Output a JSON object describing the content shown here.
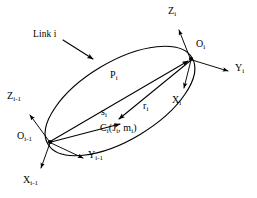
{
  "figure": {
    "kind": "kinematic-link-diagram",
    "background_color": "#ffffff",
    "ink_color": "#000000",
    "width": 257,
    "height": 198
  },
  "annotation": {
    "link_label": "Link i",
    "leader_note": "arrow from Link i text to upper-left boundary of the link body ellipse"
  },
  "body": {
    "name": "link-body-ellipse",
    "center_x": 120,
    "center_y": 101,
    "radius_x": 84,
    "radius_y": 39,
    "rotation_deg": -31
  },
  "frames": [
    {
      "id": "frame-i-minus-1",
      "origin_label": "O",
      "origin_subscript": "i-1",
      "origin_x": 50,
      "origin_y": 142,
      "axes": [
        {
          "id": "z-axis",
          "label": "Z",
          "subscript": "i-1",
          "tip_x": 28,
          "tip_y": 112
        },
        {
          "id": "y-axis",
          "label": "Y",
          "subscript": "i-1",
          "tip_x": 86,
          "tip_y": 160
        },
        {
          "id": "x-axis",
          "label": "X",
          "subscript": "i-1",
          "tip_x": 39,
          "tip_y": 171
        }
      ]
    },
    {
      "id": "frame-i",
      "origin_label": "O",
      "origin_subscript": "i",
      "origin_x": 191,
      "origin_y": 59,
      "axes": [
        {
          "id": "z-axis",
          "label": "Z",
          "subscript": "i",
          "tip_x": 178,
          "tip_y": 27
        },
        {
          "id": "y-axis",
          "label": "Y",
          "subscript": "i",
          "tip_x": 231,
          "tip_y": 73
        },
        {
          "id": "x-axis",
          "label": "X",
          "subscript": "i",
          "tip_x": 184,
          "tip_y": 91
        }
      ]
    }
  ],
  "mass_center": {
    "id": "center-of-mass",
    "label": "C",
    "subscript": "i",
    "parenthetical": "(J",
    "paren_sub_1": "i",
    "paren_mid": ", m",
    "paren_sub_2": "i",
    "paren_close": ")",
    "full_text": "Ci(Ji, mi)",
    "point_x": 120,
    "point_y": 122
  },
  "vectors": [
    {
      "id": "vector-p",
      "label": "P",
      "subscript": "i",
      "from": "O_i-1",
      "to": "O_i",
      "start_x": 50,
      "start_y": 142,
      "end_x": 191,
      "end_y": 59
    },
    {
      "id": "vector-s",
      "label": "s",
      "subscript": "i",
      "from": "O_i-1",
      "to": "C_i",
      "start_x": 50,
      "start_y": 142,
      "end_x": 123,
      "end_y": 124
    },
    {
      "id": "vector-r",
      "label": "r",
      "subscript": "i",
      "from": "O_i",
      "to": "C_i",
      "start_x": 191,
      "start_y": 59,
      "end_x": 117,
      "end_y": 119
    }
  ],
  "labels": {
    "link": {
      "text": "Link i",
      "x": 33,
      "y": 36
    },
    "p_vector": {
      "base": "P",
      "sub": "i",
      "x": 110,
      "y": 76
    },
    "s_vector": {
      "base": "s",
      "sub": "i",
      "x": 101,
      "y": 113
    },
    "r_vector": {
      "base": "r",
      "sub": "i",
      "x": 143,
      "y": 107
    },
    "x_i": {
      "base": "X",
      "sub": "i",
      "x": 172,
      "y": 101
    },
    "y_i": {
      "base": "Y",
      "sub": "i",
      "x": 235,
      "y": 68
    },
    "z_i": {
      "base": "Z",
      "sub": "i",
      "x": 168,
      "y": 11
    },
    "o_i": {
      "base": "O",
      "sub": "i",
      "x": 196,
      "y": 44
    },
    "x_im1": {
      "base": "X",
      "sub": "i-1",
      "x": 23,
      "y": 180
    },
    "y_im1": {
      "base": "Y",
      "sub": "i-1",
      "x": 88,
      "y": 155
    },
    "z_im1": {
      "base": "Z",
      "sub": "i-1",
      "x": 7,
      "y": 96
    },
    "o_im1": {
      "base": "O",
      "sub": "i-1",
      "x": 17,
      "y": 136
    },
    "c_i": {
      "text_main": "C",
      "sub_main": "i",
      "x": 100,
      "y": 128
    }
  }
}
